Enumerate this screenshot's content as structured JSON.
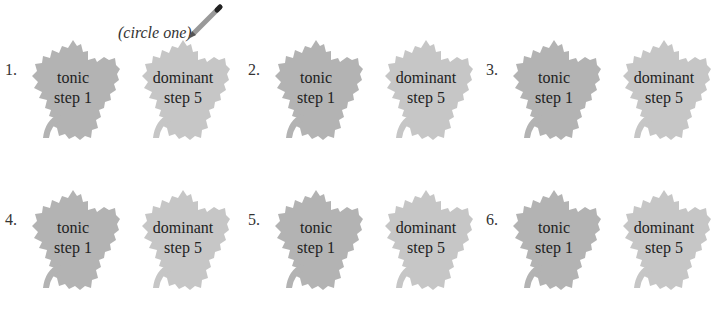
{
  "instruction": "(circle one)",
  "icons": {
    "pencil": "pencil-icon",
    "leaf": "leaf-icon"
  },
  "colors": {
    "tonic_leaf": "#b3b3b3",
    "dominant_leaf": "#c6c6c6",
    "text": "#222222"
  },
  "items": [
    {
      "number": "1.",
      "tonic": {
        "name": "tonic",
        "step": "step 1"
      },
      "dominant": {
        "name": "dominant",
        "step": "step 5"
      }
    },
    {
      "number": "2.",
      "tonic": {
        "name": "tonic",
        "step": "step 1"
      },
      "dominant": {
        "name": "dominant",
        "step": "step 5"
      }
    },
    {
      "number": "3.",
      "tonic": {
        "name": "tonic",
        "step": "step 1"
      },
      "dominant": {
        "name": "dominant",
        "step": "step 5"
      }
    },
    {
      "number": "4.",
      "tonic": {
        "name": "tonic",
        "step": "step 1"
      },
      "dominant": {
        "name": "dominant",
        "step": "step 5"
      }
    },
    {
      "number": "5.",
      "tonic": {
        "name": "tonic",
        "step": "step 1"
      },
      "dominant": {
        "name": "dominant",
        "step": "step 5"
      }
    },
    {
      "number": "6.",
      "tonic": {
        "name": "tonic",
        "step": "step 1"
      },
      "dominant": {
        "name": "dominant",
        "step": "step 5"
      }
    }
  ]
}
